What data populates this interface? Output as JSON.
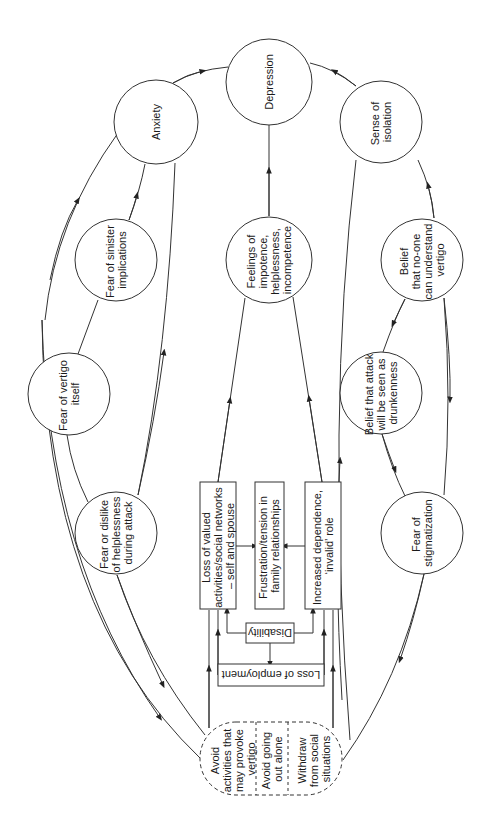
{
  "diagram": {
    "title": "",
    "orientation": "rotated -90deg (text reads bottom-to-top)",
    "circles": {
      "depression": [
        "Depression"
      ],
      "anxiety": [
        "Anxiety"
      ],
      "isolation": [
        "Sense of",
        "isolation"
      ],
      "sinister": [
        "Fear of sinister",
        "implications"
      ],
      "impotence": [
        "Feelings of",
        "impotence,",
        "helplessness,",
        "incompetence"
      ],
      "no_one": [
        "Belief",
        "that no-one",
        "can understand",
        "vertigo"
      ],
      "vertigo_itself": [
        "Fear of vertigo",
        "itself"
      ],
      "drunkenness": [
        "Belief that attack",
        "will be seen as",
        "drunkenness"
      ],
      "helplessness_attack": [
        "Fear or dislike",
        "of helplessness",
        "during attack"
      ],
      "stigmatization": [
        "Fear of",
        "stigmatization"
      ]
    },
    "boxes": {
      "loss_valued": [
        "Loss of valued",
        "activities/social networks",
        "– self and spouse"
      ],
      "frustration": [
        "Frustration/tension in",
        "family relationships"
      ],
      "dependence": [
        "Increased dependence,",
        "‘invalid’ role"
      ],
      "disability": [
        "Disability"
      ],
      "employment": [
        "Loss of employment"
      ]
    },
    "avoidance_group": {
      "avoid_activities": [
        "Avoid",
        "activities that",
        "may provoke",
        "vertigo"
      ],
      "avoid_alone": [
        "Avoid going",
        "out alone"
      ],
      "withdraw": [
        "Withdraw",
        "from social",
        "situations"
      ]
    },
    "colors": {
      "line": "#333333",
      "text": "#1a1a1a",
      "background": "#ffffff"
    }
  }
}
